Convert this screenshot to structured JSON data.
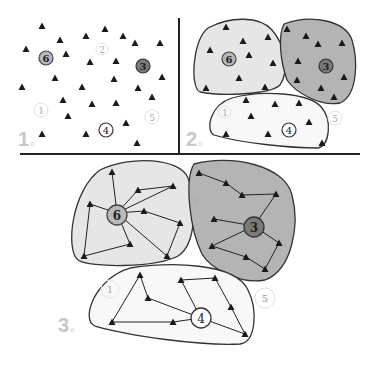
{
  "panels": [
    {
      "label": "1",
      "suffix": "o",
      "description": "Scattered sensor nodes with candidate cluster heads"
    },
    {
      "label": "2",
      "suffix": "o",
      "description": "Nodes grouped into clusters around heads 6, 3, 4"
    },
    {
      "label": "3",
      "suffix": "o",
      "description": "Intra-cluster routing paths to cluster heads"
    }
  ],
  "nodes": {
    "heads": [
      {
        "id": "1",
        "style": "faint"
      },
      {
        "id": "2",
        "style": "faint"
      },
      {
        "id": "3",
        "style": "dark",
        "fill": "#7a7a7a"
      },
      {
        "id": "4",
        "style": "outline",
        "fill": "#ffffff"
      },
      {
        "id": "5",
        "style": "faint"
      },
      {
        "id": "6",
        "style": "light",
        "fill": "#b8b8b8"
      }
    ]
  },
  "colors": {
    "cluster_6": "#e6e6e6",
    "cluster_3": "#b4b4b4",
    "cluster_4": "#f8f8f8",
    "sensor": "#1a1a1a",
    "divider": "#222222",
    "label": "#c8c8c8"
  }
}
